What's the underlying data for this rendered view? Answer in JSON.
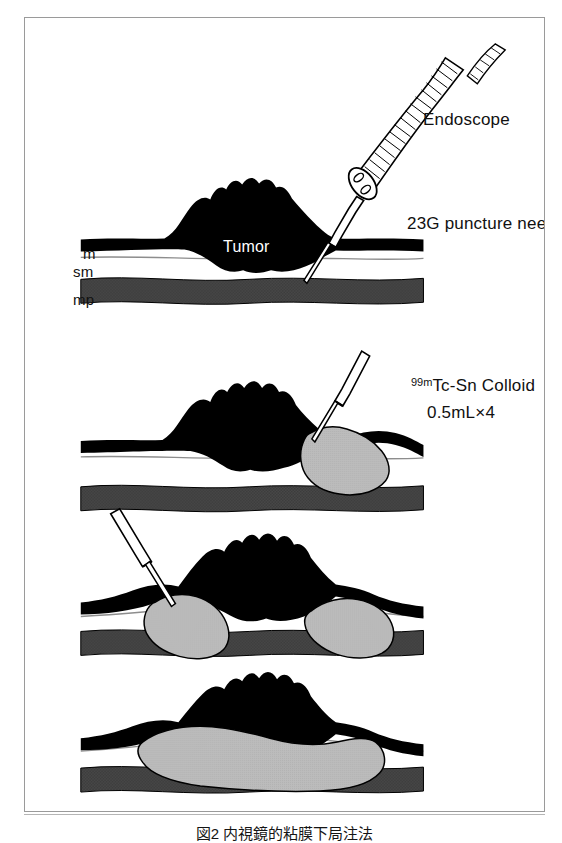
{
  "figure": {
    "title_caption": "図2 内視鏡的粘膜下局注法",
    "panel_count": 4,
    "frame_color": "#9a9a9a",
    "background_color": "#ffffff"
  },
  "labels": {
    "endoscope": "Endoscope",
    "puncture_needle": "23G puncture needle",
    "tumor": "Tumor",
    "layer_m": "m",
    "layer_sm": "sm",
    "layer_mp": "mp",
    "colloid_prefix": "99m",
    "colloid_name": "Tc-Sn Colloid",
    "dose": "0.5mL×4"
  },
  "colors": {
    "tumor_fill": "#000000",
    "mucosa_fill": "#000000",
    "submucosa_fill": "#ffffff",
    "muscularis_fill": "#4a4a4a",
    "colloid_fill": "#b9b9b9",
    "outline": "#000000",
    "frame": "#9a9a9a",
    "label_text": "#111111",
    "tumor_text": "#ffffff"
  },
  "panels": [
    {
      "index": 1,
      "name": "needle-insertion",
      "description": "Endoscope with 23G puncture needle approaching tumor; needle tip penetrating mucosa at right tumor margin",
      "colloid_blobs": 0,
      "shows_endoscope": true,
      "shows_needle": true,
      "needle_side": "right"
    },
    {
      "index": 2,
      "name": "first-injection-right",
      "description": "Colloid injected into submucosa at right side of tumor forming single gray depot",
      "colloid_blobs": 1,
      "shows_endoscope": false,
      "shows_needle": true,
      "needle_side": "right"
    },
    {
      "index": 3,
      "name": "second-injection-left",
      "description": "Needle entering from upper left; colloid depots now on both sides of tumor",
      "colloid_blobs": 2,
      "shows_endoscope": false,
      "shows_needle": true,
      "needle_side": "left"
    },
    {
      "index": 4,
      "name": "coalesced-depot",
      "description": "Injected colloid coalesced into one continuous submucosal pool beneath the tumor",
      "colloid_blobs": 1,
      "shows_endoscope": false,
      "shows_needle": false,
      "needle_side": "none"
    }
  ],
  "layer_legend": [
    {
      "abbr": "m",
      "meaning": "mucosa"
    },
    {
      "abbr": "sm",
      "meaning": "submucosa"
    },
    {
      "abbr": "mp",
      "meaning": "muscularis propria"
    }
  ]
}
